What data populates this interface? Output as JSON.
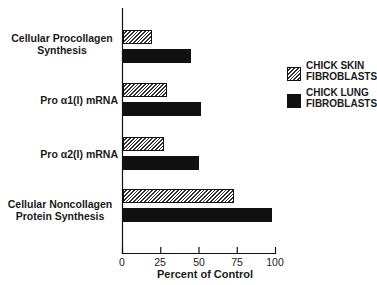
{
  "chart_data": {
    "type": "bar",
    "orientation": "horizontal",
    "title": "",
    "xlabel": "Percent of Control",
    "ylabel": "",
    "xlim": [
      0,
      100
    ],
    "xticks": [
      0,
      25,
      50,
      75,
      100
    ],
    "grid": false,
    "legend_position": "right",
    "categories": [
      "Cellular Procollagen Synthesis",
      "Pro α1(I) mRNA",
      "Pro α2(I) mRNA",
      "Cellular Noncollagen Protein Synthesis"
    ],
    "series": [
      {
        "name": "CHICK SKIN FIBROBLASTS",
        "pattern": "hatched",
        "values": [
          19,
          29,
          27,
          73
        ]
      },
      {
        "name": "CHICK LUNG FIBROBLASTS",
        "pattern": "solid",
        "values": [
          45,
          51,
          50,
          98
        ]
      }
    ]
  },
  "labels": {
    "cat0_line1": "Cellular Procollagen",
    "cat0_line2": "Synthesis",
    "cat1": "Pro α1(I) mRNA",
    "cat2": "Pro α2(I) mRNA",
    "cat3_line1": "Cellular Noncollagen",
    "cat3_line2": "Protein Synthesis",
    "xlabel": "Percent of Control",
    "ticks": [
      "0",
      "25",
      "50",
      "75",
      "100"
    ]
  },
  "legend": {
    "skin_line1": "CHICK SKIN",
    "skin_line2": "FIBROBLASTS",
    "lung_line1": "CHICK LUNG",
    "lung_line2": "FIBROBLASTS"
  },
  "colors": {
    "solid_bar": "#111111",
    "hatch_stroke": "#333333",
    "background": "#ffffff"
  }
}
